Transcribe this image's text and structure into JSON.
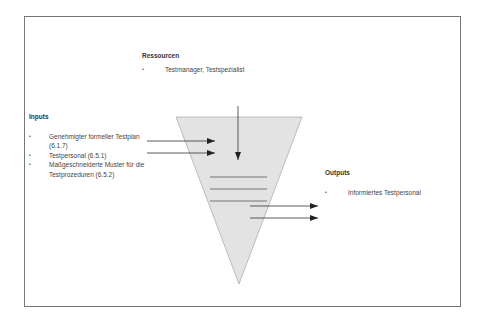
{
  "resources": {
    "heading": "Ressourcen",
    "items": [
      "Testmanager, Testspezialist"
    ]
  },
  "inputs": {
    "heading": "Inputs",
    "items": [
      "Genehmigter formeller Testplan (6.1.7)",
      "Testpersonal (6.5.1)",
      "Maßgeschneiderte Muster für die Testprozeduren (6.5.2)"
    ]
  },
  "outputs": {
    "heading": "Outputs",
    "items": [
      "Informiertes Testpersonal"
    ]
  },
  "colors": {
    "funnel_fill": "#e3e3e3",
    "line": "#333333",
    "frame": "#777777"
  }
}
